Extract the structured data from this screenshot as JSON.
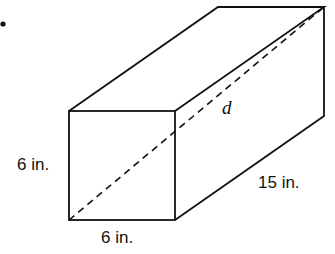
{
  "diagram": {
    "type": "rectangular-prism",
    "bullet": "•",
    "labels": {
      "height": "6 in.",
      "width": "6 in.",
      "length": "15 in.",
      "diagonal": "d"
    },
    "colors": {
      "stroke": "#111111",
      "background": "#ffffff"
    },
    "vertices": {
      "front_top_left": [
        69,
        111
      ],
      "front_top_right": [
        175,
        111
      ],
      "front_bottom_left": [
        69,
        220
      ],
      "front_bottom_right": [
        175,
        220
      ],
      "back_top_left": [
        218,
        7
      ],
      "back_top_right": [
        324,
        7
      ],
      "back_bottom_right": [
        324,
        116
      ]
    }
  }
}
